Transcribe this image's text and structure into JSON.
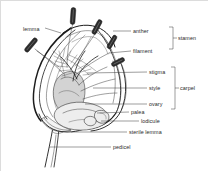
{
  "figure": {
    "background_color": "#ffffff",
    "ink_color": "#1c1c1c",
    "label_color": "#2a2a2a",
    "shade_color": "#d3d3d3"
  },
  "labels": [
    {
      "id": "lemma",
      "text": "lemma",
      "x": 22,
      "y": 30,
      "anchor": "start"
    },
    {
      "id": "anther",
      "text": "anther",
      "x": 132,
      "y": 32,
      "anchor": "start"
    },
    {
      "id": "filament",
      "text": "filament",
      "x": 132,
      "y": 52,
      "anchor": "start"
    },
    {
      "id": "stamen",
      "text": "stamen",
      "x": 176,
      "y": 43,
      "anchor": "start"
    },
    {
      "id": "stigma",
      "text": "stigma",
      "x": 148,
      "y": 73,
      "anchor": "start"
    },
    {
      "id": "style",
      "text": "style",
      "x": 148,
      "y": 89,
      "anchor": "start"
    },
    {
      "id": "ovary",
      "text": "ovary",
      "x": 148,
      "y": 105,
      "anchor": "start"
    },
    {
      "id": "carpel",
      "text": "carpel",
      "x": 178,
      "y": 89,
      "anchor": "start"
    },
    {
      "id": "palea",
      "text": "palea",
      "x": 130,
      "y": 113,
      "anchor": "start"
    },
    {
      "id": "lodicule",
      "text": "lodicule",
      "x": 140,
      "y": 122,
      "anchor": "start"
    },
    {
      "id": "sterile-lemma",
      "text": "sterile lemma",
      "x": 128,
      "y": 133,
      "anchor": "start"
    },
    {
      "id": "pedicel",
      "text": "pedicel",
      "x": 112,
      "y": 148,
      "anchor": "start"
    }
  ],
  "groups": [
    {
      "id": "stamen-bracket",
      "label": "stamen",
      "members": [
        "anther",
        "filament"
      ]
    },
    {
      "id": "carpel-bracket",
      "label": "carpel",
      "members": [
        "stigma",
        "style",
        "ovary"
      ]
    }
  ],
  "parts": [
    {
      "id": "lemma",
      "name": "lemma"
    },
    {
      "id": "anther",
      "name": "anther"
    },
    {
      "id": "filament",
      "name": "filament"
    },
    {
      "id": "stigma",
      "name": "stigma"
    },
    {
      "id": "style",
      "name": "style"
    },
    {
      "id": "ovary",
      "name": "ovary"
    },
    {
      "id": "palea",
      "name": "palea"
    },
    {
      "id": "lodicule",
      "name": "lodicule"
    },
    {
      "id": "sterile-lemma",
      "name": "sterile lemma"
    },
    {
      "id": "pedicel",
      "name": "pedicel"
    }
  ]
}
